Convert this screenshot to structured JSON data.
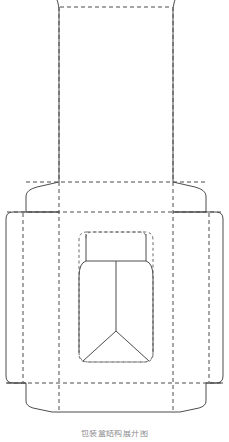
{
  "document": {
    "title": "Packaging Dieline Drawing",
    "description": "Flat die-cut layout of a folding carton with bottle-shaped display window",
    "background_color": "#ffffff",
    "cut_line_color": "#4d4d4f",
    "fold_line_color": "#6b6b6e",
    "line_style_cut": "solid",
    "line_style_fold": "dashed"
  },
  "canvas": {
    "width": 229,
    "height": 442,
    "units": "px"
  },
  "caption": {
    "text": "包装盒结构展开图",
    "visible": true
  },
  "panels": [
    {
      "id": "top-flap",
      "name": "Top Closure Flap",
      "x": 59,
      "y": 0,
      "width": 114,
      "height": 182,
      "shape": "rectangle-with-chamfered-top"
    },
    {
      "id": "top-shoulder-left",
      "name": "Left Top Shoulder Tab",
      "x": 26,
      "y": 182,
      "width": 33,
      "height": 30,
      "shape": "trapezoid"
    },
    {
      "id": "top-shoulder-right",
      "name": "Right Top Shoulder Tab",
      "x": 173,
      "y": 182,
      "width": 33,
      "height": 30,
      "shape": "trapezoid"
    },
    {
      "id": "main-body",
      "name": "Main Body Panel",
      "x": 6,
      "y": 212,
      "width": 217,
      "height": 171,
      "shape": "rounded-rectangle",
      "corner_radius": 7
    },
    {
      "id": "left-glue-tab",
      "name": "Left Glue Tab",
      "x": 6,
      "y": 212,
      "width": 17,
      "height": 171
    },
    {
      "id": "right-glue-tab",
      "name": "Right Glue Tab",
      "x": 209,
      "y": 212,
      "width": 14,
      "height": 171
    },
    {
      "id": "bottom-flap",
      "name": "Bottom Closure Flap",
      "x": 26,
      "y": 383,
      "width": 180,
      "height": 29,
      "shape": "trapezoid-chamfered"
    }
  ],
  "window": {
    "id": "bottle-window",
    "name": "Bottle Display Window",
    "outline_shape": "rounded-rectangle",
    "x": 79,
    "y": 232,
    "width": 74,
    "height": 130,
    "corner_radius": 8,
    "contents": [
      {
        "id": "bottle-neck",
        "name": "Bottle Neck / Cap Outline",
        "shape": "rounded-rectangle",
        "x": 86,
        "y": 232,
        "width": 60,
        "height": 29,
        "corner_radius": 6
      },
      {
        "id": "bottle-body",
        "name": "Bottle Body Outline",
        "shape": "rounded-rectangle-with-pointed-base",
        "x": 79,
        "y": 261,
        "width": 74,
        "height": 101,
        "corner_radius": 14
      },
      {
        "id": "bottle-center-score",
        "name": "Center Vertical Score Line",
        "x1": 116,
        "y1": 261,
        "x2": 116,
        "y2": 331
      },
      {
        "id": "bottle-base-vee",
        "name": "Base V Fold Lines",
        "apex_x": 116,
        "apex_y": 331,
        "left_x": 84,
        "left_y": 362,
        "right_x": 148,
        "right_y": 362
      }
    ]
  },
  "fold_lines": {
    "vertical": [
      {
        "name": "left-glue-fold",
        "x": 23,
        "y1": 212,
        "y2": 383
      },
      {
        "name": "left-body-fold",
        "x": 59,
        "y1": 0,
        "y2": 412
      },
      {
        "name": "right-body-fold",
        "x": 173,
        "y1": 0,
        "y2": 412
      },
      {
        "name": "right-glue-fold",
        "x": 209,
        "y1": 212,
        "y2": 383
      }
    ],
    "horizontal": [
      {
        "name": "top-flap-fold",
        "x1": 61,
        "y1": 7,
        "x2": 171,
        "y2": 7
      },
      {
        "name": "top-shoulder-fold",
        "x1": 23,
        "y1": 182,
        "x2": 209,
        "y2": 182
      },
      {
        "name": "body-top-fold",
        "x1": 6,
        "y1": 212,
        "x2": 223,
        "y2": 212
      },
      {
        "name": "body-bottom-fold",
        "x1": 6,
        "y1": 383,
        "x2": 223,
        "y2": 383
      }
    ]
  }
}
